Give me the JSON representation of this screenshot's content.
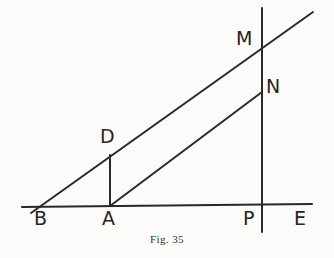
{
  "figure": {
    "caption": "Fig. 35",
    "background_color": "#fbfbf9",
    "stroke_color": "#2a2927",
    "stroke_width": 2,
    "label_color": "#262523"
  },
  "labels": {
    "B": "B",
    "A": "A",
    "D": "D",
    "M": "M",
    "N": "N",
    "P": "P",
    "E": "E"
  },
  "chart_data": {
    "type": "diagram",
    "title": "Fig. 35",
    "points": [
      {
        "name": "B",
        "x": 42,
        "y": 206,
        "label_x": 34,
        "label_y": 209
      },
      {
        "name": "A",
        "x": 110,
        "y": 206,
        "label_x": 102,
        "label_y": 209
      },
      {
        "name": "D",
        "x": 110,
        "y": 157,
        "label_x": 100,
        "label_y": 127
      },
      {
        "name": "M",
        "x": 261,
        "y": 47,
        "label_x": 236,
        "label_y": 29
      },
      {
        "name": "N",
        "x": 261,
        "y": 93,
        "label_x": 266,
        "label_y": 77
      },
      {
        "name": "P",
        "x": 261,
        "y": 206,
        "label_x": 243,
        "label_y": 209
      },
      {
        "name": "E",
        "x": 296,
        "y": 206,
        "label_x": 294,
        "label_y": 209
      }
    ],
    "segments": [
      {
        "name": "base-line",
        "from": [
          22,
          207
        ],
        "to": [
          312,
          204
        ]
      },
      {
        "name": "vertical-line-P",
        "from": [
          262,
          8
        ],
        "to": [
          262,
          232
        ]
      },
      {
        "name": "oblique-line-BM",
        "from": [
          31,
          213
        ],
        "to": [
          313,
          12
        ]
      },
      {
        "name": "oblique-line-AN",
        "from": [
          110,
          206
        ],
        "to": [
          262,
          92
        ]
      },
      {
        "name": "segment-AD",
        "from": [
          110,
          206
        ],
        "to": [
          110,
          155
        ]
      }
    ]
  }
}
